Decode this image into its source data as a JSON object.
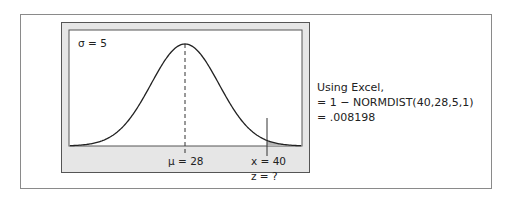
{
  "figure": {
    "sigma_label": "σ = 5",
    "mu_label": "μ = 28",
    "x_label": "x = 40",
    "z_label": "z = ?"
  },
  "note": {
    "lines": [
      "Using Excel,",
      "= 1 − NORMDIST(40,28,5,1)",
      "= .008198"
    ]
  },
  "chart_data": {
    "type": "area",
    "title": "",
    "distribution": "normal",
    "mean": 28,
    "sd": 5,
    "marked_x": 40,
    "shaded_region": "right tail x > 40",
    "tail_probability": 0.008198,
    "annotations": [
      "σ = 5",
      "μ = 28",
      "x = 40",
      "z = ?"
    ]
  }
}
